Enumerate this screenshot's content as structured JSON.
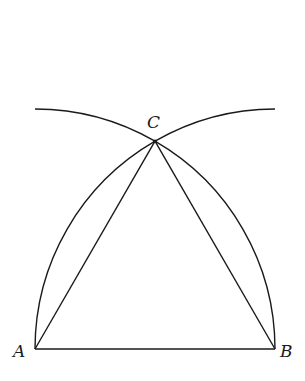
{
  "diagram": {
    "points": {
      "A": {
        "label": "A",
        "x": 35,
        "y": 349
      },
      "B": {
        "label": "B",
        "x": 275,
        "y": 349
      },
      "C": {
        "label": "C",
        "x": 155,
        "y": 141
      }
    },
    "segments": [
      {
        "from": "A",
        "to": "B"
      },
      {
        "from": "A",
        "to": "C"
      },
      {
        "from": "B",
        "to": "C"
      }
    ],
    "arcs": [
      {
        "center": "A",
        "radius": 240,
        "description": "circle about A through B and C"
      },
      {
        "center": "B",
        "radius": 240,
        "description": "circle about B through A and C"
      }
    ],
    "colors": {
      "stroke": "#1a1a1a",
      "background": "#ffffff"
    }
  }
}
